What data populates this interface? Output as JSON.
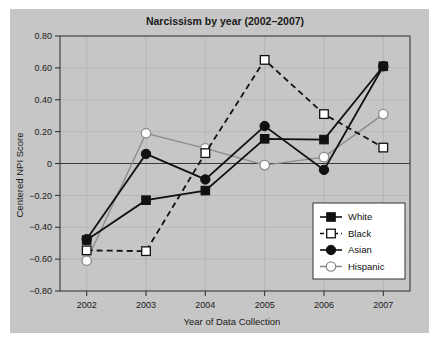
{
  "chart_data": {
    "type": "line",
    "title": "Narcissism by year (2002–2007)",
    "xlabel": "Year of Data Collection",
    "ylabel": "Centered NPI Score",
    "categories": [
      "2002",
      "2003",
      "2004",
      "2005",
      "2006",
      "2007"
    ],
    "x": [
      2002,
      2003,
      2004,
      2005,
      2006,
      2007
    ],
    "xlim": [
      2001.55,
      2007.45
    ],
    "ylim": [
      -0.8,
      0.8
    ],
    "yticks": [
      -0.8,
      -0.6,
      -0.4,
      -0.2,
      0,
      0.2,
      0.4,
      0.6,
      0.8
    ],
    "ytick_labels": [
      "-0.80",
      "-0.60",
      "-0.40",
      "-0.20",
      "0",
      "0.20",
      "0.40",
      "0.60",
      "0.80"
    ],
    "xticks": [
      2002,
      2003,
      2004,
      2005,
      2006,
      2007
    ],
    "xtick_labels": [
      "2002",
      "2003",
      "2004",
      "2005",
      "2006",
      "2007"
    ],
    "grid": true,
    "legend_position": "bottom-right",
    "series": [
      {
        "name": "White",
        "marker": "filled-square",
        "line": "solid",
        "color": "#111111",
        "values": [
          -0.48,
          -0.23,
          -0.17,
          0.155,
          0.15,
          0.61
        ]
      },
      {
        "name": "Black",
        "marker": "open-square",
        "line": "dashed",
        "color": "#111111",
        "values": [
          -0.545,
          -0.55,
          0.065,
          0.65,
          0.31,
          0.1
        ]
      },
      {
        "name": "Asian",
        "marker": "filled-circle",
        "line": "solid",
        "color": "#111111",
        "values": [
          -0.475,
          0.06,
          -0.1,
          0.235,
          -0.04,
          0.61
        ]
      },
      {
        "name": "Hispanic",
        "marker": "open-circle",
        "line": "solid",
        "color": "#8c8c8c",
        "values": [
          -0.61,
          0.19,
          0.095,
          -0.01,
          0.04,
          0.31
        ]
      }
    ]
  },
  "colors": {
    "figure_background": "#c6c6c6",
    "page_background": "#ffffff",
    "axis": "#2b2b2b",
    "grid": "#b3b3b3",
    "legend_background": "#ffffff"
  }
}
